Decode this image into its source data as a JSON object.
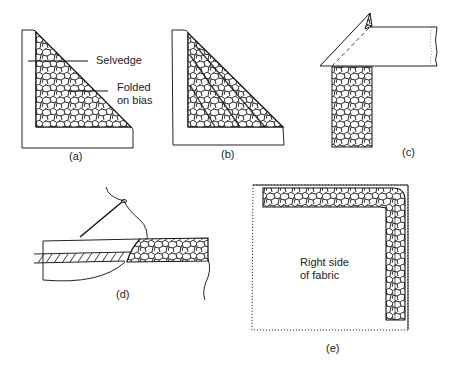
{
  "figure": {
    "panels": [
      {
        "id": "a",
        "caption": "(a)",
        "labels": {
          "selvedge": "Selvedge",
          "folded_line1": "Folded",
          "folded_line2": "on bias"
        }
      },
      {
        "id": "b",
        "caption": "(b)"
      },
      {
        "id": "c",
        "caption": "(c)"
      },
      {
        "id": "d",
        "caption": "(d)"
      },
      {
        "id": "e",
        "caption": "(e)",
        "labels": {
          "line1": "Right side",
          "line2": "of fabric"
        }
      }
    ]
  }
}
